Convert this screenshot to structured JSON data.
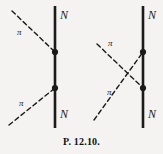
{
  "figure": {
    "caption": "P. 12.10.",
    "background_color": "#f4f3f1",
    "ink_color": "#1a1a1a",
    "width": 163,
    "height": 154,
    "diagrams": [
      {
        "id": "diagram-left",
        "name": "direct-channel-diagram",
        "nucleon_line": {
          "label_top": "N",
          "label_bottom": "N",
          "x": 55,
          "y_top": 6,
          "y_bottom": 128
        },
        "vertices": [
          {
            "name": "upper-vertex",
            "x": 55,
            "y": 52
          },
          {
            "name": "lower-vertex",
            "x": 55,
            "y": 88
          }
        ],
        "pion_lines": [
          {
            "name": "incoming-pion-upper",
            "label": "π",
            "label_x": 17,
            "label_y": 28,
            "x1": 12,
            "y1": 11,
            "x2": 55,
            "y2": 52
          },
          {
            "name": "outgoing-pion-lower",
            "label": "π",
            "label_x": 19,
            "label_y": 99,
            "x1": 9,
            "y1": 125,
            "x2": 55,
            "y2": 88
          }
        ]
      },
      {
        "id": "diagram-right",
        "name": "crossed-channel-diagram",
        "nucleon_line": {
          "label_top": "N",
          "label_bottom": "N",
          "x": 143,
          "y_top": 6,
          "y_bottom": 128
        },
        "vertices": [
          {
            "name": "upper-vertex",
            "x": 143,
            "y": 52
          },
          {
            "name": "lower-vertex",
            "x": 143,
            "y": 88
          }
        ],
        "pion_lines": [
          {
            "name": "pion-upper-left-to-lower-vertex",
            "label": "π",
            "label_x": 108,
            "label_y": 39,
            "x1": 97,
            "y1": 44,
            "x2": 143,
            "y2": 88
          },
          {
            "name": "pion-lower-left-to-upper-vertex",
            "label": "π",
            "label_x": 107,
            "label_y": 88,
            "x1": 94,
            "y1": 120,
            "x2": 143,
            "y2": 52
          }
        ],
        "crossing_point": {
          "x": 122,
          "y": 70
        }
      }
    ],
    "labels": {
      "nucleon": "N",
      "pion": "π"
    }
  }
}
